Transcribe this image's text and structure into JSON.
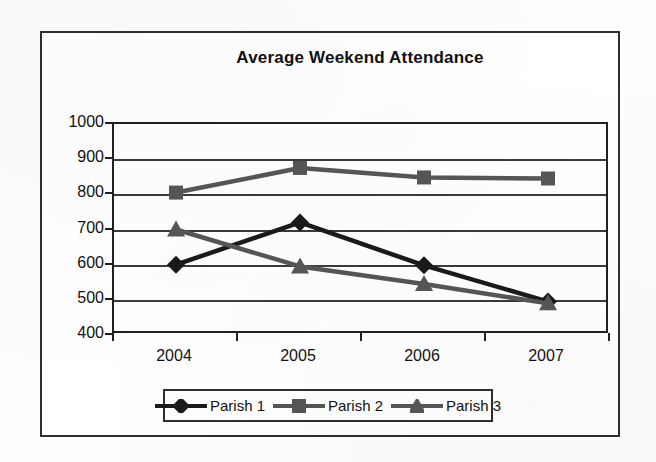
{
  "chart_data": {
    "type": "line",
    "title": "Average Weekend Attendance",
    "xlabel": "",
    "ylabel": "",
    "categories": [
      "2004",
      "2005",
      "2006",
      "2007"
    ],
    "ylim": [
      400,
      1000
    ],
    "yticks": [
      1000,
      900,
      800,
      700,
      600,
      500,
      400
    ],
    "ytick_labels": [
      "1000",
      "900",
      "800",
      "700",
      "600",
      "500",
      "400"
    ],
    "grid": true,
    "legend_position": "bottom",
    "series": [
      {
        "name": "Parish 1",
        "marker": "diamond",
        "color": "#1a1a1a",
        "values": [
          600,
          720,
          598,
          495
        ]
      },
      {
        "name": "Parish 2",
        "marker": "square",
        "color": "#565656",
        "values": [
          805,
          875,
          848,
          845
        ]
      },
      {
        "name": "Parish 3",
        "marker": "triangle",
        "color": "#565656",
        "values": [
          700,
          595,
          545,
          490
        ]
      }
    ]
  },
  "colors": {
    "frame": "#2e2e2e",
    "axis": "#202020",
    "gridline": "#3a3a3a",
    "plot_background": "#ffffff",
    "page_background": "#fdfdfd",
    "text": "#111111"
  }
}
